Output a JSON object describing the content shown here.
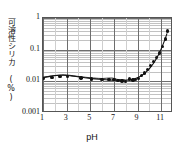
{
  "chart_data": {
    "type": "scatter",
    "title": "",
    "xlabel": "pH",
    "ylabel": "可溶性シリカ (%)",
    "xscale": "linear",
    "yscale": "log",
    "xlim": [
      1,
      12
    ],
    "ylim": [
      0.001,
      1
    ],
    "grid": true,
    "grid_minor": true,
    "legend": "none",
    "xticks": [
      "1",
      "3",
      "5",
      "7",
      "9",
      "11"
    ],
    "xtick_values": [
      1,
      3,
      5,
      7,
      9,
      11
    ],
    "yticks": [
      "0.001",
      "0.01",
      "0.1",
      "1"
    ],
    "ytick_values": [
      0.001,
      0.01,
      0.1,
      1
    ],
    "series": [
      {
        "name": "可溶性シリカ 測定値",
        "marker": "filled-circle",
        "color": "#111111",
        "x": [
          1.05,
          1.75,
          2.45,
          3.05,
          4.2,
          5.1,
          6.0,
          6.6,
          7.0,
          7.35,
          7.7,
          8.0,
          8.3,
          8.6,
          8.85,
          9.1,
          9.35,
          9.6,
          9.85,
          10.1,
          10.35,
          10.6,
          10.85,
          11.1,
          11.35,
          11.55
        ],
        "y": [
          0.0125,
          0.0135,
          0.0145,
          0.0145,
          0.0128,
          0.0118,
          0.0112,
          0.0115,
          0.0115,
          0.0105,
          0.0102,
          0.01,
          0.0118,
          0.011,
          0.0112,
          0.0125,
          0.015,
          0.0185,
          0.0235,
          0.031,
          0.042,
          0.056,
          0.079,
          0.125,
          0.215,
          0.39
        ]
      },
      {
        "name": "近似曲線",
        "marker": "none",
        "type": "line",
        "color": "#111111",
        "x": [
          1.0,
          1.6,
          2.2,
          2.8,
          3.4,
          4.0,
          4.6,
          5.2,
          5.8,
          6.4,
          7.0,
          7.4,
          7.8,
          8.2,
          8.6,
          9.0,
          9.3,
          9.6,
          9.9,
          10.2,
          10.5,
          10.8,
          11.1,
          11.4,
          11.65
        ],
        "y": [
          0.0118,
          0.0131,
          0.014,
          0.0142,
          0.0136,
          0.0127,
          0.0118,
          0.0111,
          0.0106,
          0.0102,
          0.0099,
          0.0098,
          0.0098,
          0.0099,
          0.0103,
          0.0113,
          0.0127,
          0.015,
          0.0186,
          0.0245,
          0.0345,
          0.053,
          0.09,
          0.17,
          0.31
        ]
      }
    ]
  }
}
